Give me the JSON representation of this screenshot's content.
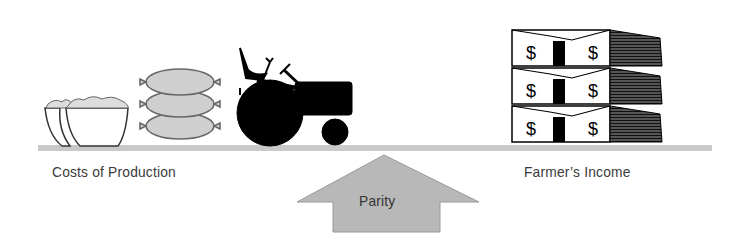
{
  "diagram": {
    "type": "balance",
    "left_label": "Costs of Production",
    "right_label": "Farmer’s Income",
    "fulcrum_label": "Parity",
    "left_items": [
      "bowls-of-grain",
      "stacked-grain-sacks",
      "tractor"
    ],
    "right_items": [
      "stacked-money-bundles"
    ],
    "money_symbol": "$",
    "colors": {
      "beam": "#c9c9c9",
      "arrow": "#b8b8b8",
      "ink": "#000000",
      "sack": "#cfcfcf",
      "text": "#3a3a3a"
    }
  }
}
